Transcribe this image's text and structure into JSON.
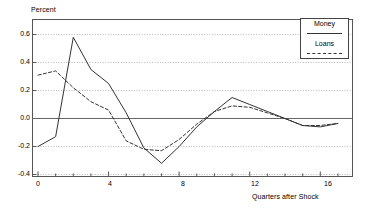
{
  "chart_data": {
    "type": "line",
    "title": "",
    "xlabel": "Quarters after Shock",
    "ylabel": "Percent",
    "x": [
      0,
      1,
      2,
      3,
      4,
      5,
      6,
      7,
      8,
      9,
      10,
      11,
      12,
      13,
      14,
      15,
      16,
      17
    ],
    "xlim": [
      0,
      17.4
    ],
    "ylim": [
      -0.4,
      0.7
    ],
    "xticks": [
      0,
      4,
      8,
      12,
      16
    ],
    "xtick_labels": [
      "0",
      "4",
      "8",
      "12",
      "16"
    ],
    "xminor_ticks": [
      1,
      2,
      3,
      5,
      6,
      7,
      9,
      10,
      11,
      13,
      14,
      15,
      17
    ],
    "yticks": [
      -0.4,
      -0.2,
      0.0,
      0.2,
      0.4,
      0.6
    ],
    "ytick_labels": [
      "-0.4",
      "-0.2",
      "0.0",
      "0.2",
      "0.4",
      "0.6"
    ],
    "grid": true,
    "grid_style": "dotted-horizontal",
    "zero_line": true,
    "legend_position": "top-right",
    "series": [
      {
        "name": "Money",
        "style": "solid",
        "color": "#333333",
        "values": [
          -0.2,
          -0.13,
          0.58,
          0.35,
          0.25,
          0.04,
          -0.21,
          -0.32,
          -0.2,
          -0.06,
          0.05,
          0.15,
          0.1,
          0.05,
          0.0,
          -0.05,
          -0.06,
          -0.035
        ]
      },
      {
        "name": "Loans",
        "style": "dashed",
        "color": "#333333",
        "values": [
          0.31,
          0.34,
          0.22,
          0.12,
          0.06,
          -0.16,
          -0.22,
          -0.23,
          -0.15,
          -0.04,
          0.05,
          0.09,
          0.08,
          0.04,
          0.0,
          -0.05,
          -0.05,
          -0.035
        ]
      }
    ]
  },
  "legend": {
    "items": [
      {
        "label": "Money",
        "style": "solid"
      },
      {
        "label": "Loans",
        "style": "dashed"
      }
    ]
  },
  "axes": {
    "ylabel": "Percent",
    "xlabel": "Quarters after Shock"
  }
}
